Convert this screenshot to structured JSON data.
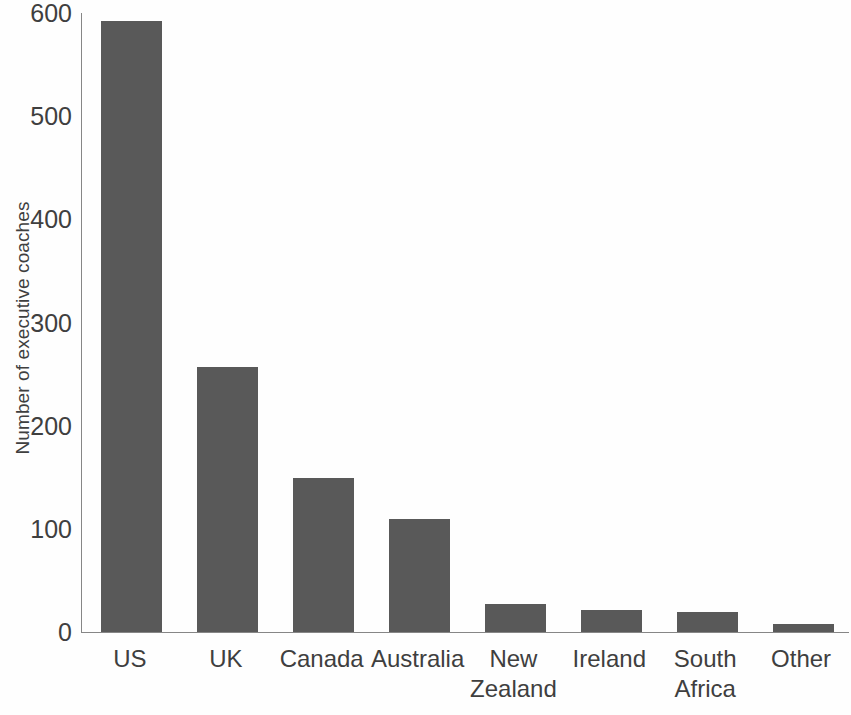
{
  "chart_data": {
    "type": "bar",
    "title": "",
    "subtitle": "",
    "xlabel": "",
    "ylabel": "Number of executive coaches",
    "categories": [
      "US",
      "UK",
      "Canada",
      "Australia",
      "New Zealand",
      "Ireland",
      "South Africa",
      "Other"
    ],
    "values": [
      592,
      257,
      149,
      110,
      27,
      21,
      19,
      8
    ],
    "ylim": [
      0,
      600
    ],
    "yticks": [
      0,
      100,
      200,
      300,
      400,
      500,
      600
    ],
    "ytick_labels": [
      "0",
      "100",
      "200",
      "300",
      "400",
      "500",
      "600"
    ],
    "grid": false,
    "legend": null,
    "bar_color": "#595959",
    "axis_color": "#868686",
    "text_color": "#3f3f3f",
    "series": [
      {
        "name": "Number of executive coaches",
        "values": [
          592,
          257,
          149,
          110,
          27,
          21,
          19,
          8
        ]
      }
    ],
    "category_label_lines": [
      [
        "US"
      ],
      [
        "UK"
      ],
      [
        "Canada"
      ],
      [
        "Australia"
      ],
      [
        "New",
        "Zealand"
      ],
      [
        "Ireland"
      ],
      [
        "South",
        "Africa"
      ],
      [
        "Other"
      ]
    ]
  }
}
